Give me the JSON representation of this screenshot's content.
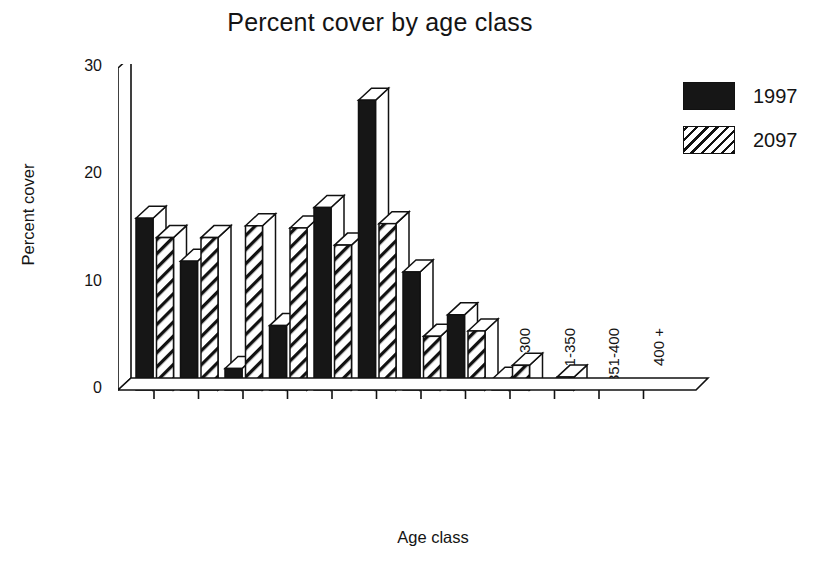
{
  "chart_data": {
    "type": "bar",
    "title": "Percent cover by age class",
    "xlabel": "Age class",
    "ylabel": "Percent cover",
    "categories": [
      "0-20",
      "21-40",
      "41-60",
      "61-80",
      "81-100",
      "101-150",
      "151-200",
      "201-250",
      "251-300",
      "301-350",
      "351-400",
      "400 +"
    ],
    "series": [
      {
        "name": "1997",
        "fill": "solid",
        "color": "#161616",
        "values": [
          16,
          12,
          2,
          6,
          17,
          27,
          11,
          7,
          1,
          0,
          0,
          0
        ]
      },
      {
        "name": "2097",
        "fill": "hatch",
        "color": "#ffffff",
        "values": [
          14.2,
          14.2,
          15.3,
          15.1,
          13.5,
          15.5,
          5,
          5.5,
          2.3,
          1.2,
          0,
          0
        ]
      }
    ],
    "ylim": [
      0,
      30
    ],
    "yticks": [
      0,
      10,
      20,
      30
    ],
    "ytick_labels": [
      "0",
      "10",
      "20",
      "30"
    ],
    "grid": false,
    "legend_position": "top-right",
    "style": "3d-extruded-bars"
  },
  "legend": {
    "entries": [
      {
        "label": "1997",
        "swatch": "solid-black-swatch"
      },
      {
        "label": "2097",
        "swatch": "diagonal-hatch-swatch"
      }
    ]
  },
  "colors": {
    "series_1997": "#161616",
    "series_2097": "#ffffff",
    "axis": "#111111",
    "background": "#ffffff",
    "text": "#141414"
  }
}
